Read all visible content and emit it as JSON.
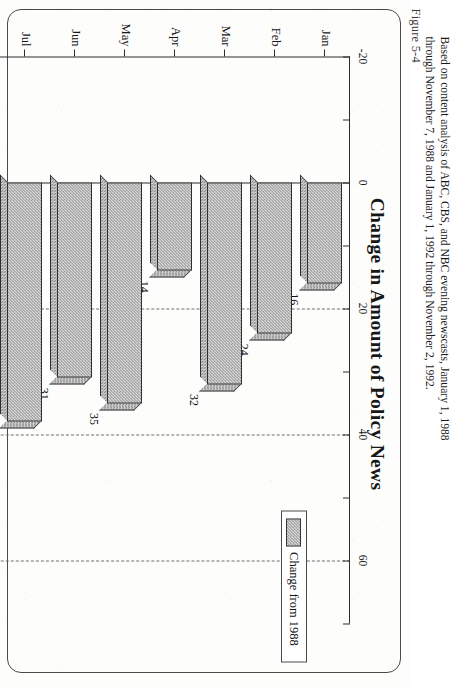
{
  "figure": {
    "number": "Figure 5-4"
  },
  "chart_data": {
    "type": "bar",
    "orientation": "horizontal",
    "title": "Change in Amount of Policy News",
    "xlabel": "Number of Stories",
    "ylabel": "",
    "categories": [
      "Jan",
      "Feb",
      "Mar",
      "Apr",
      "May",
      "Jun",
      "Jul",
      "Aug",
      "Sep",
      "Oct",
      "Nov"
    ],
    "values": [
      16,
      24,
      32,
      14,
      35,
      31,
      38,
      60,
      21,
      22,
      -14
    ],
    "series": [
      {
        "name": "Change from 1988",
        "values": [
          16,
          24,
          32,
          14,
          35,
          31,
          38,
          60,
          21,
          22,
          -14
        ]
      }
    ],
    "value_axis_title": "Number of Stories",
    "tick_labels": [
      "-20",
      "0",
      "20",
      "40",
      "60"
    ],
    "tick_values": [
      -20,
      0,
      20,
      40,
      60
    ],
    "xlim": [
      -20,
      70
    ],
    "grid": "dashed vertical gridlines at 20, 40, 60",
    "legend": {
      "position": "right-inside",
      "entries": [
        "Change from 1988"
      ]
    },
    "data_labels": [
      "16",
      "24",
      "32",
      "14",
      "35",
      "31",
      "38",
      "60",
      "21",
      "22",
      "-14"
    ]
  },
  "legend": {
    "label": "Change from 1988"
  },
  "caption": {
    "line1": "Based on content analysis of ABC, CBS, and NBC evening newscasts, January 1, 1988",
    "line2": "through November 7, 1988 and January 1, 1992 through November 2, 1992."
  },
  "colors": {
    "bar_fill": "#d9d9d9",
    "bar_hatch": "#8e8e8e",
    "axis": "#2c2c2c",
    "grid": "#6f6f6f",
    "frame": "#4a4a4a",
    "text": "#111111"
  }
}
